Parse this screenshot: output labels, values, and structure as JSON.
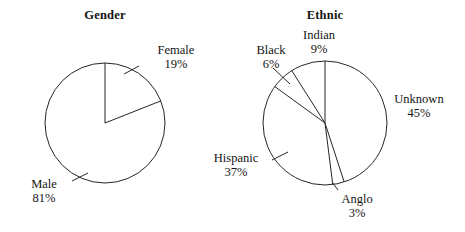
{
  "figure": {
    "width": 465,
    "height": 232,
    "background": "#ffffff",
    "stroke_color": "#262626",
    "text_color": "#141414"
  },
  "charts": [
    {
      "id": "gender",
      "title": "Gender",
      "center_x": 105,
      "center_y": 123,
      "radius": 60,
      "labels": [
        {
          "name": "Female",
          "pct": "19%"
        },
        {
          "name": "Male",
          "pct": "81%"
        }
      ]
    },
    {
      "id": "ethnic",
      "title": "Ethnic",
      "center_x": 325,
      "center_y": 123,
      "radius": 62,
      "labels": [
        {
          "name": "Indian",
          "pct": "9%"
        },
        {
          "name": "Black",
          "pct": "6%"
        },
        {
          "name": "Unknown",
          "pct": "45%"
        },
        {
          "name": "Hispanic",
          "pct": "37%"
        },
        {
          "name": "Anglo",
          "pct": "3%"
        }
      ]
    }
  ],
  "chart_data": [
    {
      "type": "pie",
      "title": "Gender",
      "categories": [
        "Female",
        "Male"
      ],
      "values": [
        19,
        81
      ],
      "value_labels": [
        "19%",
        "81%"
      ],
      "units": "percent",
      "start_angle_deg": 0,
      "direction": "clockwise",
      "slice_fill": "#ffffff",
      "slice_stroke": "#262626",
      "legend": "none",
      "labels_position": "outside-with-leader-lines"
    },
    {
      "type": "pie",
      "title": "Ethnic",
      "categories": [
        "Unknown",
        "Anglo",
        "Hispanic",
        "Black",
        "Indian"
      ],
      "values": [
        45,
        3,
        37,
        6,
        9
      ],
      "value_labels": [
        "45%",
        "3%",
        "37%",
        "6%",
        "9%"
      ],
      "units": "percent",
      "start_angle_deg": 0,
      "direction": "clockwise",
      "slice_fill": "#ffffff",
      "slice_stroke": "#262626",
      "legend": "none",
      "labels_position": "outside-with-leader-lines"
    }
  ]
}
